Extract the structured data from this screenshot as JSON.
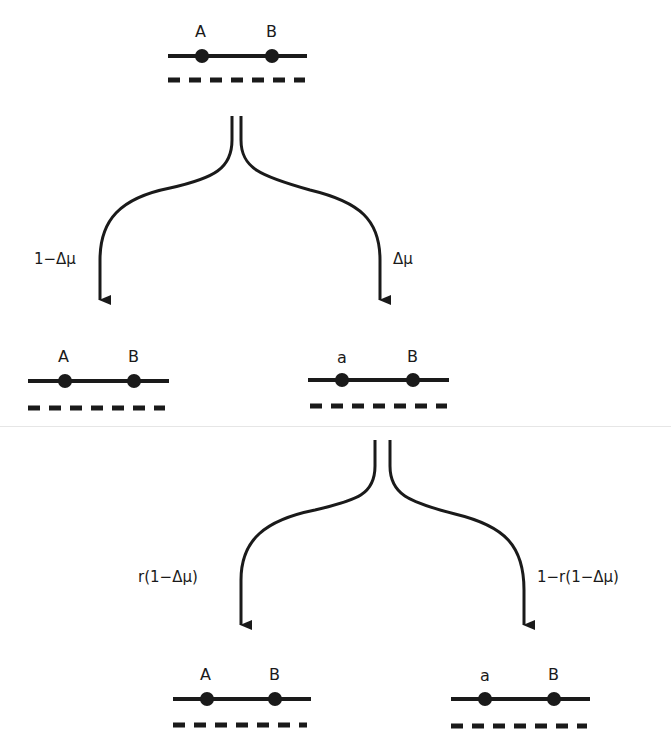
{
  "diagram": {
    "type": "branching-genotype-tree",
    "colors": {
      "ink": "#1a1a1a",
      "divider": "#e6e6e6"
    },
    "nodes": [
      {
        "id": "root",
        "locus1": "A",
        "locus2": "B"
      },
      {
        "id": "left_mid",
        "locus1": "A",
        "locus2": "B"
      },
      {
        "id": "right_mid",
        "locus1": "a",
        "locus2": "B"
      },
      {
        "id": "left_bottom",
        "locus1": "A",
        "locus2": "B"
      },
      {
        "id": "right_bottom",
        "locus1": "a",
        "locus2": "B"
      }
    ],
    "edges": [
      {
        "from": "root",
        "to": "left_mid",
        "label": "1−Δμ"
      },
      {
        "from": "root",
        "to": "right_mid",
        "label": "Δμ"
      },
      {
        "from": "right_mid",
        "to": "left_bottom",
        "label": "r(1−Δμ)"
      },
      {
        "from": "right_mid",
        "to": "right_bottom",
        "label": "1−r(1−Δμ)"
      }
    ]
  }
}
